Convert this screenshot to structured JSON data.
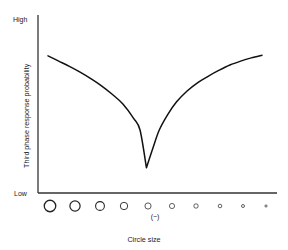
{
  "chart_data": {
    "type": "line",
    "title": "",
    "xlabel": "Circle size",
    "ylabel": "Third phase response probability",
    "ylim": [
      0,
      1
    ],
    "xlim": [
      0,
      10
    ],
    "grid": false,
    "legend": null,
    "y_tick_labels": [
      "High",
      "Low"
    ],
    "y_tick_values": [
      1,
      0
    ],
    "x_tick_labels": [],
    "annotations": [
      {
        "text": "(−)",
        "x": 4.6,
        "y": -0.13
      }
    ],
    "x_markers": {
      "description": "row of open circles of decreasing diameter below the x-axis",
      "centers_px": [
        50,
        75,
        100,
        124,
        148,
        172,
        196,
        220,
        243,
        266
      ],
      "diameters_px": [
        11.5,
        10.2,
        8.8,
        7.4,
        6.2,
        5.2,
        4.4,
        3.6,
        3.0,
        2.2
      ]
    },
    "series": [
      {
        "name": "Third phase response probability",
        "comment": "V-shaped curve: high at both extremes of circle size, sharp minimum at the (−) standard circle size",
        "x": [
          0.0,
          0.5,
          1.0,
          1.5,
          2.0,
          2.5,
          3.0,
          3.5,
          4.0,
          4.3,
          4.6,
          4.9,
          5.2,
          5.6,
          6.0,
          6.5,
          7.0,
          7.5,
          8.0,
          8.5,
          9.0,
          9.5,
          10.0
        ],
        "y": [
          0.97,
          0.93,
          0.89,
          0.845,
          0.795,
          0.74,
          0.675,
          0.6,
          0.49,
          0.4,
          0.11,
          0.26,
          0.4,
          0.52,
          0.615,
          0.7,
          0.765,
          0.815,
          0.86,
          0.9,
          0.93,
          0.955,
          0.975
        ]
      }
    ]
  },
  "geometry": {
    "axis_color": "#333333",
    "curve_color": "#111111",
    "marker_stroke": "#222222"
  }
}
